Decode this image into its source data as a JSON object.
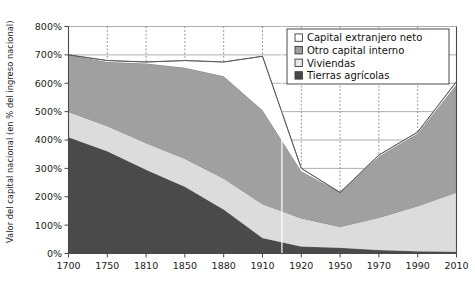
{
  "chart_data": {
    "type": "area",
    "title": "",
    "xlabel": "",
    "ylabel": "Valor del capital nacional (en % del ingreso nacional)",
    "ylim": [
      0,
      800
    ],
    "ytick_labels": [
      "0%",
      "100%",
      "200%",
      "300%",
      "400%",
      "500%",
      "600%",
      "700%",
      "800%"
    ],
    "ytick_values": [
      0,
      100,
      200,
      300,
      400,
      500,
      600,
      700,
      800
    ],
    "categories": [
      "1700",
      "1750",
      "1810",
      "1850",
      "1880",
      "1910",
      "1920",
      "1950",
      "1970",
      "1990",
      "2010"
    ],
    "x": [
      1700,
      1750,
      1810,
      1850,
      1880,
      1910,
      1920,
      1950,
      1970,
      1990,
      2010
    ],
    "stacked": true,
    "grid": "vertical-dashed-and-horizontal-solid",
    "legend_position": "top-right",
    "series": [
      {
        "name": "Tierras agrícolas",
        "color": "#4a4a4a",
        "values": [
          410,
          360,
          295,
          235,
          155,
          55,
          25,
          20,
          12,
          8,
          6
        ]
      },
      {
        "name": "Viviendas",
        "color": "#dcdcdc",
        "values": [
          90,
          90,
          95,
          100,
          110,
          120,
          100,
          75,
          115,
          160,
          210
        ]
      },
      {
        "name": "Otro capital interno",
        "color": "#a0a0a0",
        "values": [
          200,
          225,
          280,
          320,
          360,
          330,
          165,
          120,
          215,
          255,
          380
        ]
      },
      {
        "name": "Capital extranjero neto",
        "color": "#ffffff",
        "values": [
          0,
          5,
          5,
          25,
          50,
          190,
          10,
          0,
          5,
          5,
          10
        ]
      }
    ],
    "total_line": {
      "name": "Total",
      "values": [
        700,
        680,
        675,
        680,
        675,
        695,
        300,
        215,
        347,
        428,
        606
      ]
    },
    "annotations": {
      "vertical_marker_year": "1915"
    }
  },
  "legend": {
    "items": [
      {
        "label": "Capital extranjero neto",
        "swatch": "white-square-icon",
        "color": "#ffffff"
      },
      {
        "label": "Otro capital interno",
        "swatch": "gray-square-icon",
        "color": "#a0a0a0"
      },
      {
        "label": "Viviendas",
        "swatch": "light-square-icon",
        "color": "#e8e8e8"
      },
      {
        "label": "Tierras agrícolas",
        "swatch": "dark-square-icon",
        "color": "#4a4a4a"
      }
    ]
  }
}
